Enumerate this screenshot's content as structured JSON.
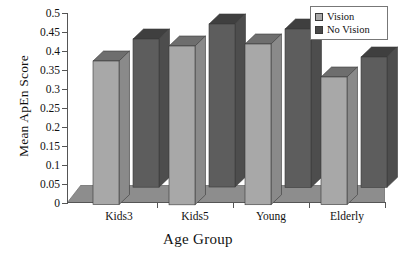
{
  "chart_data": {
    "type": "bar",
    "title": "",
    "xlabel": "Age Group",
    "ylabel": "Mean ApEn Score",
    "categories": [
      "Kids3",
      "Kids5",
      "Young",
      "Elderly"
    ],
    "ylim": [
      0,
      0.5
    ],
    "ytick_labels": [
      "0",
      "0.05",
      "0.1",
      "0.15",
      "0.2",
      "0.25",
      "0.3",
      "0.35",
      "0.4",
      "0.45",
      "0.5"
    ],
    "ytick_values": [
      0,
      0.05,
      0.1,
      0.15,
      0.2,
      0.25,
      0.3,
      0.35,
      0.4,
      0.45,
      0.5
    ],
    "grid": false,
    "legend_position": "top-right",
    "three_d": true,
    "series": [
      {
        "name": "Vision",
        "color": "#a8a8a8",
        "values": [
          0.378,
          0.418,
          0.423,
          0.336
        ]
      },
      {
        "name": "No Vision",
        "color": "#5a5a5a",
        "values": [
          0.39,
          0.429,
          0.417,
          0.343
        ]
      }
    ]
  },
  "legend": {
    "items": [
      {
        "label": "Vision",
        "swatch": "#a8a8a8"
      },
      {
        "label": "No Vision",
        "swatch": "#4a4a4a"
      }
    ]
  },
  "colors": {
    "axis": "#555555",
    "floor": "#8d8d8d",
    "vision_face": "#a8a8a8",
    "vision_top": "#6e6e6e",
    "vision_side": "#8a8a8a",
    "novision_face": "#5d5d5d",
    "novision_top": "#3f3f3f",
    "novision_side": "#4d4d4d",
    "background": "#ffffff"
  }
}
